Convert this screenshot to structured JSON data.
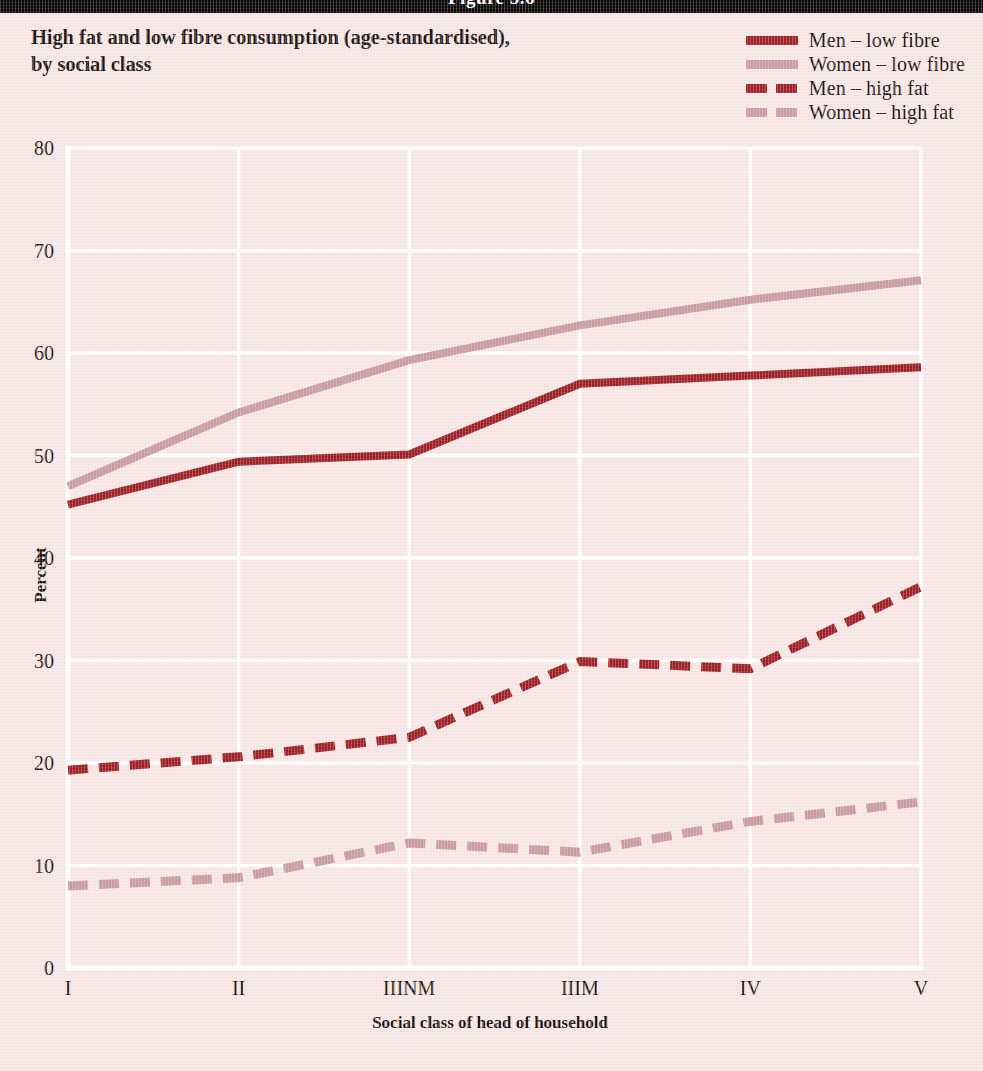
{
  "figure_banner": {
    "label": "Figure 5.6"
  },
  "title": {
    "line1": "High fat and low fibre consumption (age-standardised),",
    "line2": "by social class"
  },
  "colors": {
    "background": "#f7e7e5",
    "men_dark_red": "#9d1f25",
    "women_light_pink": "#c89ba0",
    "gridline": "#ffffff",
    "banner": "#080808",
    "text": "#1b1210"
  },
  "legend": {
    "position": "top-right",
    "entries": [
      {
        "label": "Men – low fibre",
        "color": "#9d1f25",
        "style": "solid"
      },
      {
        "label": "Women – low fibre",
        "color": "#c89ba0",
        "style": "solid"
      },
      {
        "label": "Men – high fat",
        "color": "#9d1f25",
        "style": "dashed"
      },
      {
        "label": "Women – high fat",
        "color": "#c89ba0",
        "style": "dashed"
      }
    ]
  },
  "chart_data": {
    "type": "line",
    "title": "High fat and low fibre consumption (age-standardised), by social class",
    "xlabel": "Social class of head of household",
    "ylabel": "Percent",
    "categories": [
      "I",
      "II",
      "IIINM",
      "IIIM",
      "IV",
      "V"
    ],
    "ylim": [
      0,
      80
    ],
    "yticks": [
      0,
      10,
      20,
      30,
      40,
      50,
      60,
      70,
      80
    ],
    "ytick_labels": [
      "0",
      "10",
      "20",
      "30",
      "40",
      "50",
      "60",
      "70",
      "80"
    ],
    "grid": "horizontal-and-vertical",
    "legend_position": "top-right",
    "series": [
      {
        "name": "Men – low fibre",
        "style": "solid",
        "color": "#9d1f25",
        "values": [
          45.2,
          49.4,
          50.1,
          57.0,
          57.8,
          58.6
        ]
      },
      {
        "name": "Women – low fibre",
        "style": "solid",
        "color": "#c89ba0",
        "values": [
          47.0,
          54.2,
          59.3,
          62.7,
          65.2,
          67.1
        ]
      },
      {
        "name": "Men – high fat",
        "style": "dashed",
        "color": "#9d1f25",
        "values": [
          19.3,
          20.6,
          22.5,
          29.9,
          29.2,
          37.2
        ]
      },
      {
        "name": "Women – high fat",
        "style": "dashed",
        "color": "#c89ba0",
        "values": [
          8.0,
          8.8,
          12.2,
          11.3,
          14.3,
          16.2
        ]
      }
    ]
  }
}
